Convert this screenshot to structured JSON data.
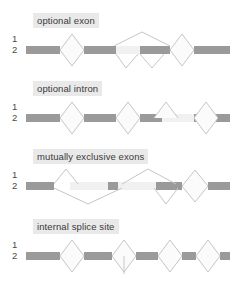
{
  "figure": {
    "title": "",
    "type": "alternative-splicing-diagram",
    "background_color": "#ffffff",
    "bar_color": "#9a9a9a",
    "line_color": "#c6c6c6",
    "label_background": "#e9e9e9",
    "label_text_color": "#3a3a3a",
    "row_number_color": "#4a4a4a"
  },
  "panels": [
    {
      "id": "optional-exon",
      "label": "optional exon",
      "isoform_rows": [
        "1",
        "2"
      ],
      "description": "cassette exon included in isoform 1 and skipped in isoform 2"
    },
    {
      "id": "optional-intron",
      "label": "optional intron",
      "isoform_rows": [
        "1",
        "2"
      ],
      "description": "intron retained in one isoform and spliced out in the other"
    },
    {
      "id": "mutually-exclusive-exons",
      "label": "mutually exclusive exons",
      "isoform_rows": [
        "1",
        "2"
      ],
      "description": "one of two adjacent exons is included but never both"
    },
    {
      "id": "internal-splice-site",
      "label": "internal splice site",
      "isoform_rows": [
        "1",
        "2"
      ],
      "description": "alternative donor or acceptor site inside an exon"
    }
  ]
}
